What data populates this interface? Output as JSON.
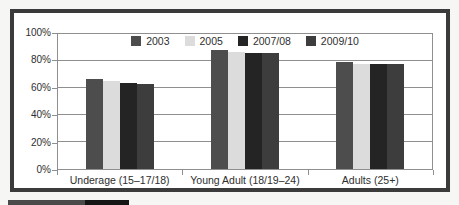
{
  "page": {
    "background": "#f6f6f4"
  },
  "chart_frame": {
    "border_color": "#3b3b3b",
    "background": "#ffffff"
  },
  "caption_stub": {
    "left_color": "#4a4a4a",
    "right_color": "#151515"
  },
  "chart_data": {
    "type": "bar",
    "title": "",
    "categories": [
      "Underage (15–17/18)",
      "Young Adult (18/19–24)",
      "Adults (25+)"
    ],
    "series": [
      {
        "name": "2003",
        "color": "#4d4d4d",
        "values": [
          67,
          88,
          79
        ]
      },
      {
        "name": "2005",
        "color": "#dcdcdc",
        "values": [
          65,
          87,
          78
        ]
      },
      {
        "name": "2007/08",
        "color": "#242424",
        "values": [
          64,
          86,
          78
        ]
      },
      {
        "name": "2009/10",
        "color": "#3d3d3d",
        "values": [
          63,
          86,
          78
        ]
      }
    ],
    "ylabel": "",
    "xlabel": "",
    "ylim": [
      0,
      100
    ],
    "y_tick_step": 20,
    "y_tick_labels": [
      "0%",
      "20%",
      "40%",
      "60%",
      "80%",
      "100%"
    ],
    "grid": true,
    "legend_position": "top-center",
    "axis_color": "#8f8f8f",
    "text_color": "#2e2e2e"
  }
}
